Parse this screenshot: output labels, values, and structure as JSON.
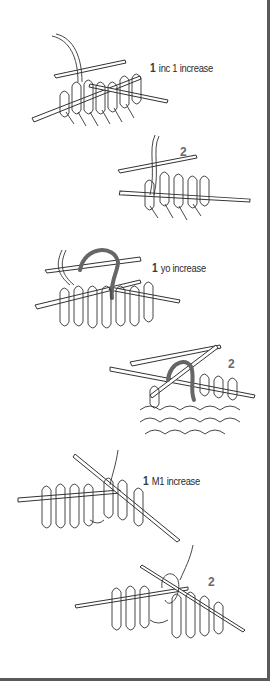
{
  "sections": [
    {
      "name": "inc 1 increase",
      "step1": {
        "number": "1",
        "label": "inc 1 increase"
      },
      "step2": {
        "number": "2"
      }
    },
    {
      "name": "yo increase",
      "step1": {
        "number": "1",
        "label": "yo increase"
      },
      "step2": {
        "number": "2"
      }
    },
    {
      "name": "M1 increase",
      "step1": {
        "number": "1",
        "label": "M1 increase"
      },
      "step2": {
        "number": "2"
      }
    }
  ],
  "colors": {
    "border": "#5a5a5a",
    "line": "#333333",
    "highlight_yarn": "#666666",
    "step_number": "#6a6a6a"
  }
}
